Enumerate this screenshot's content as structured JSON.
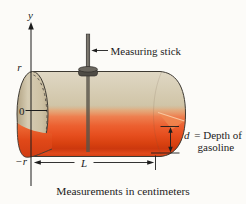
{
  "figure": {
    "caption": "Measurements in centimeters",
    "axis": {
      "label": "y",
      "tick_top": "r",
      "tick_middle": "0",
      "tick_bottom": "−r"
    },
    "annotations": {
      "measuring_stick": "Measuring stick",
      "depth_symbol": "d",
      "depth_text": "= Depth of",
      "depth_text_line2": "gasoline",
      "length_symbol": "L"
    },
    "colors": {
      "tank_body_tan": "#cfc3a6",
      "tank_highlight": "#ddd4c0",
      "tank_shadow": "#b7a887",
      "gasoline_red": "#e64a1c",
      "gasoline_light": "#ec9c66",
      "gasoline_dark": "#cc380e",
      "stick_gray": "#575248",
      "line_black": "#1c1c1c",
      "background": "#fcfbf8"
    }
  }
}
